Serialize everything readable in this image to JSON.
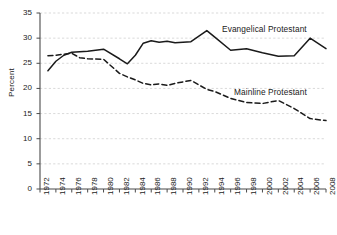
{
  "chart_data": {
    "type": "line",
    "title": "",
    "subtitle": "",
    "xlabel": "",
    "ylabel": "Percent",
    "ylim": [
      0,
      35
    ],
    "xlim": [
      1972,
      2008
    ],
    "ytick_step": 5,
    "xtick_step": 2,
    "grid": true,
    "grid_style": "dashed-horizontal",
    "legend_position": "inline-annotations",
    "ytick_labels": [
      "0",
      "5",
      "10",
      "15",
      "20",
      "25",
      "30",
      "35"
    ],
    "ytick_values": [
      0,
      5,
      10,
      15,
      20,
      25,
      30,
      35
    ],
    "xtick_labels": [
      "1972",
      "1974",
      "1976",
      "1978",
      "1980",
      "1982",
      "1984",
      "1986",
      "1988",
      "1990",
      "1992",
      "1994",
      "1996",
      "1998",
      "2000",
      "2002",
      "2004",
      "2006",
      "2008"
    ],
    "xtick_values": [
      1972,
      1974,
      1976,
      1978,
      1980,
      1982,
      1984,
      1986,
      1988,
      1990,
      1992,
      1994,
      1996,
      1998,
      2000,
      2002,
      2004,
      2006,
      2008
    ],
    "x": [
      1973,
      1974,
      1975,
      1976,
      1977,
      1978,
      1980,
      1982,
      1983,
      1984,
      1985,
      1986,
      1987,
      1988,
      1989,
      1990,
      1991,
      1993,
      1994,
      1996,
      1998,
      2000,
      2002,
      2004,
      2006,
      2008
    ],
    "series": [
      {
        "name": "Evangelical Protestant",
        "style": "solid",
        "color": "#1a1a1a",
        "values": [
          23.5,
          25.4,
          26.6,
          27.2,
          27.3,
          27.4,
          27.8,
          25.9,
          24.9,
          26.6,
          29.0,
          29.5,
          29.2,
          29.4,
          29.1,
          29.2,
          29.3,
          31.5,
          30.2,
          27.6,
          27.9,
          27.1,
          26.4,
          26.5,
          30.0,
          27.9
        ]
      },
      {
        "name": "Mainline Protestant",
        "style": "dashed",
        "color": "#1a1a1a",
        "values": [
          26.5,
          26.6,
          26.8,
          27.0,
          26.1,
          25.9,
          25.8,
          23.0,
          22.3,
          21.7,
          21.0,
          20.7,
          20.9,
          20.6,
          21.0,
          21.3,
          21.6,
          19.8,
          19.4,
          18.0,
          17.2,
          17.0,
          17.6,
          16.0,
          14.0,
          13.6
        ]
      }
    ],
    "annotations": [
      {
        "text": "Evangelical Protestant",
        "series": "Evangelical Protestant"
      },
      {
        "text": "Mainline Protestant",
        "series": "Mainline Protestant"
      }
    ]
  }
}
